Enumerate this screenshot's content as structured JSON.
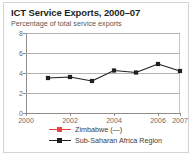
{
  "chart_data": {
    "type": "line",
    "title": "ICT Service Exports, 2000–07",
    "subtitle": "Percentage of total service exports",
    "xlabel": "",
    "ylabel": "",
    "x": [
      2000,
      2001,
      2002,
      2003,
      2004,
      2005,
      2006,
      2007
    ],
    "xlim": [
      2000,
      2007
    ],
    "ylim": [
      0,
      8
    ],
    "yticks": [
      0,
      2,
      4,
      6,
      8
    ],
    "ytick_labels": [
      "0",
      "2",
      "4",
      "6",
      "8"
    ],
    "xticks": [
      2000,
      2002,
      2004,
      2006,
      2007
    ],
    "xtick_labels": [
      "2000",
      "2002",
      "2004",
      "2006",
      "2007"
    ],
    "grid": true,
    "grid_axis": "y",
    "legend_position": "bottom",
    "series": [
      {
        "name": "Zimbabwe (—)",
        "color": "#e8453c",
        "marker": "square",
        "values": [
          null,
          null,
          null,
          null,
          null,
          null,
          null,
          null
        ],
        "note": "no data plotted"
      },
      {
        "name": "Sub-Saharan Africa Region",
        "color": "#231f20",
        "marker": "square",
        "values": [
          null,
          3.5,
          3.6,
          3.2,
          4.25,
          4.05,
          4.9,
          4.2
        ]
      }
    ]
  },
  "legend": {
    "items": [
      {
        "label": "Zimbabwe (—)",
        "color": "#e8453c"
      },
      {
        "label": "Sub-Saharan Africa Region",
        "color": "#231f20"
      }
    ]
  }
}
